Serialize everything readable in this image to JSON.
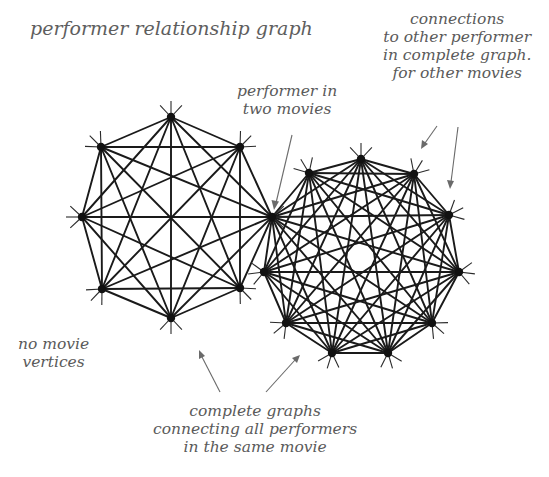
{
  "title": "performer relationship graph",
  "annotations": {
    "performer_two_movies": [
      "performer in",
      "two movies"
    ],
    "connections": [
      "connections",
      "to other performer",
      "in complete graph.",
      "for other movies"
    ],
    "no_movie_vertices": [
      "no movie",
      "vertices"
    ],
    "complete_graphs": [
      "complete graphs",
      "connecting all performers",
      "in the same movie"
    ]
  },
  "graphs": {
    "left": {
      "type": "complete graph",
      "vertex_count": 8,
      "vertices": [
        [
          171,
          117
        ],
        [
          240,
          147
        ],
        [
          272,
          217
        ],
        [
          240,
          288
        ],
        [
          171,
          318
        ],
        [
          102,
          289
        ],
        [
          82,
          217
        ],
        [
          101,
          147
        ]
      ]
    },
    "right": {
      "type": "complete graph",
      "vertex_count": 10,
      "vertices": [
        [
          272,
          217
        ],
        [
          309,
          173
        ],
        [
          361,
          159
        ],
        [
          414,
          174
        ],
        [
          449,
          215
        ],
        [
          459,
          272
        ],
        [
          432,
          323
        ],
        [
          388,
          353
        ],
        [
          332,
          353
        ],
        [
          286,
          323
        ],
        [
          264,
          272
        ]
      ]
    },
    "shared_vertex": [
      272,
      217
    ]
  },
  "colors": {
    "edge": "#1a1a1a",
    "text": "#5a5a5a",
    "arrow": "#6a6a6a",
    "background": "#ffffff"
  }
}
